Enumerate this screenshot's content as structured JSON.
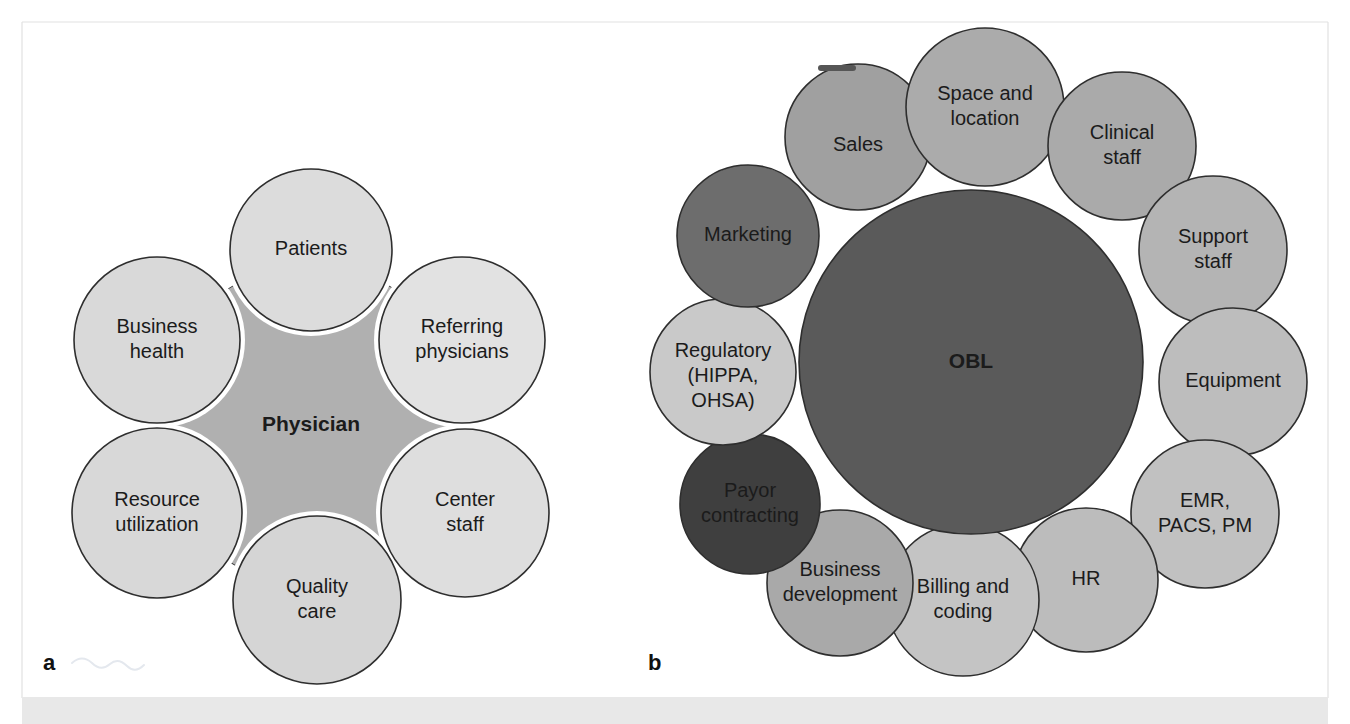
{
  "figure": {
    "background_color": "#ffffff",
    "frame_color": "#e2e2e2",
    "footer_band_color": "#e8e8e8",
    "outline_color": "#2e2e2e",
    "text_color": "#1b1b1b",
    "width": 1350,
    "height": 724
  },
  "panel_a": {
    "letter": "a",
    "hub": {
      "label": "Physician",
      "fill": "#b0b0b0",
      "cx": 311,
      "cy": 425,
      "r": 160
    },
    "satellites": [
      {
        "label": "Patients",
        "lines": [
          "Patients"
        ],
        "fill": "#dcdcdc",
        "cx": 311,
        "cy": 250,
        "r": 81
      },
      {
        "label": "Referring physicians",
        "lines": [
          "Referring",
          "physicians"
        ],
        "fill": "#e2e2e2",
        "cx": 462,
        "cy": 340,
        "r": 83
      },
      {
        "label": "Center staff",
        "lines": [
          "Center",
          "staff"
        ],
        "fill": "#dedede",
        "cx": 465,
        "cy": 513,
        "r": 84
      },
      {
        "label": "Quality care",
        "lines": [
          "Quality",
          "care"
        ],
        "fill": "#d5d5d5",
        "cx": 317,
        "cy": 600,
        "r": 84
      },
      {
        "label": "Resource utilization",
        "lines": [
          "Resource",
          "utilization"
        ],
        "fill": "#d8d8d8",
        "cx": 157,
        "cy": 513,
        "r": 85
      },
      {
        "label": "Business health",
        "lines": [
          "Business",
          "health"
        ],
        "fill": "#d9d9d9",
        "cx": 157,
        "cy": 340,
        "r": 83
      }
    ]
  },
  "panel_b": {
    "letter": "b",
    "hub": {
      "label": "OBL",
      "fill": "#5a5a5a",
      "cx": 971,
      "cy": 362,
      "r": 172
    },
    "satellites": [
      {
        "label": "Sales",
        "lines": [
          "Sales"
        ],
        "fill": "#a0a0a0",
        "cx": 858,
        "cy": 137,
        "r": 73
      },
      {
        "label": "Space and location",
        "lines": [
          "Space and",
          "location"
        ],
        "fill": "#ababab",
        "cx": 985,
        "cy": 107,
        "r": 79
      },
      {
        "label": "Clinical staff",
        "lines": [
          "Clinical",
          "staff"
        ],
        "fill": "#aaaaaa",
        "cx": 1122,
        "cy": 146,
        "r": 74
      },
      {
        "label": "Support staff",
        "lines": [
          "Support",
          "staff"
        ],
        "fill": "#b4b4b4",
        "cx": 1213,
        "cy": 250,
        "r": 74
      },
      {
        "label": "Equipment",
        "lines": [
          "Equipment"
        ],
        "fill": "#bdbdbd",
        "cx": 1233,
        "cy": 382,
        "r": 74
      },
      {
        "label": "EMR, PACS, PM",
        "lines": [
          "EMR,",
          "PACS, PM"
        ],
        "fill": "#c1c1c1",
        "cx": 1205,
        "cy": 514,
        "r": 74
      },
      {
        "label": "HR",
        "lines": [
          "HR"
        ],
        "fill": "#bcbcbc",
        "cx": 1086,
        "cy": 580,
        "r": 72
      },
      {
        "label": "Billing and coding",
        "lines": [
          "Billing and",
          "coding"
        ],
        "fill": "#c4c4c4",
        "cx": 963,
        "cy": 600,
        "r": 76
      },
      {
        "label": "Business development",
        "lines": [
          "Business",
          "development"
        ],
        "fill": "#a9a9a9",
        "cx": 840,
        "cy": 583,
        "r": 73
      },
      {
        "label": "Payor contracting",
        "lines": [
          "Payor",
          "contracting"
        ],
        "fill": "#3f3f3f",
        "cx": 750,
        "cy": 504,
        "r": 70,
        "text_color": "#111111"
      },
      {
        "label": "Regulatory (HIPPA, OHSA)",
        "lines": [
          "Regulatory",
          "(HIPPA,",
          "OHSA)"
        ],
        "fill": "#c9c9c9",
        "cx": 723,
        "cy": 372,
        "r": 73
      },
      {
        "label": "Marketing",
        "lines": [
          "Marketing"
        ],
        "fill": "#6d6d6d",
        "cx": 748,
        "cy": 236,
        "r": 71
      }
    ]
  }
}
